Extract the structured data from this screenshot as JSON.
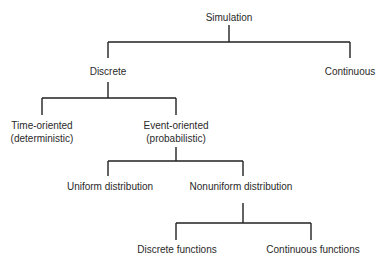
{
  "diagram": {
    "type": "tree",
    "nodes": {
      "simulation": {
        "label": "Simulation"
      },
      "discrete": {
        "label": "Discrete"
      },
      "continuous": {
        "label": "Continuous"
      },
      "time_oriented": {
        "line1": "Time-oriented",
        "line2": "(deterministic)"
      },
      "event_oriented": {
        "line1": "Event-oriented",
        "line2": "(probabilistic)"
      },
      "uniform": {
        "label": "Uniform distribution"
      },
      "nonuniform": {
        "label": "Nonuniform distribution"
      },
      "discrete_functions": {
        "label": "Discrete functions"
      },
      "continuous_functions": {
        "label": "Continuous functions"
      }
    },
    "edges": [
      [
        "simulation",
        "discrete"
      ],
      [
        "simulation",
        "continuous"
      ],
      [
        "discrete",
        "time_oriented"
      ],
      [
        "discrete",
        "event_oriented"
      ],
      [
        "event_oriented",
        "uniform"
      ],
      [
        "event_oriented",
        "nonuniform"
      ],
      [
        "nonuniform",
        "discrete_functions"
      ],
      [
        "nonuniform",
        "continuous_functions"
      ]
    ]
  }
}
